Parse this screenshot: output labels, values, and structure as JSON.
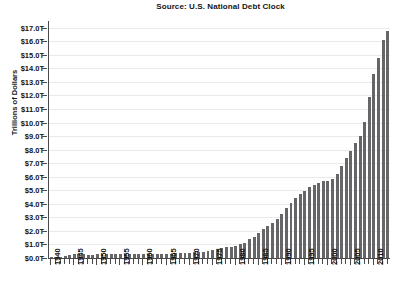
{
  "chart_data": {
    "type": "bar",
    "title": "Source: U.S. National Debt Clock",
    "xlabel": "",
    "ylabel": "Trillions of Dollars",
    "ylim": [
      0,
      17.5
    ],
    "grid": true,
    "legend": "none",
    "y_tick_labels": [
      "$0.0T",
      "$1.0T",
      "$2.0T",
      "$3.0T",
      "$4.0T",
      "$5.0T",
      "$6.0T",
      "$7.0T",
      "$8.0T",
      "$9.0T",
      "$10.0T",
      "$11.0T",
      "$12.0T",
      "$13.0T",
      "$14.0T",
      "$15.0T",
      "$16.0T",
      "$17.0T"
    ],
    "y_tick_values": [
      0,
      1,
      2,
      3,
      4,
      5,
      6,
      7,
      8,
      9,
      10,
      11,
      12,
      13,
      14,
      15,
      16,
      17
    ],
    "x_tick_labels": [
      "1940",
      "1945",
      "1950",
      "1955",
      "1960",
      "1965",
      "1970",
      "1975",
      "1980",
      "1985",
      "1990",
      "1995",
      "2000",
      "2005",
      "2010"
    ],
    "x_tick_values": [
      1940,
      1945,
      1950,
      1955,
      1960,
      1965,
      1970,
      1975,
      1980,
      1985,
      1990,
      1995,
      2000,
      2005,
      2010
    ],
    "categories": [
      1940,
      1941,
      1942,
      1943,
      1944,
      1945,
      1946,
      1947,
      1948,
      1949,
      1950,
      1951,
      1952,
      1953,
      1954,
      1955,
      1956,
      1957,
      1958,
      1959,
      1960,
      1961,
      1962,
      1963,
      1964,
      1965,
      1966,
      1967,
      1968,
      1969,
      1970,
      1971,
      1972,
      1973,
      1974,
      1975,
      1976,
      1977,
      1978,
      1979,
      1980,
      1981,
      1982,
      1983,
      1984,
      1985,
      1986,
      1987,
      1988,
      1989,
      1990,
      1991,
      1992,
      1993,
      1994,
      1995,
      1996,
      1997,
      1998,
      1999,
      2000,
      2001,
      2002,
      2003,
      2004,
      2005,
      2006,
      2007,
      2008,
      2009,
      2010,
      2011,
      2012,
      2013
    ],
    "values": [
      0.05,
      0.06,
      0.08,
      0.14,
      0.2,
      0.26,
      0.27,
      0.26,
      0.25,
      0.25,
      0.26,
      0.26,
      0.26,
      0.27,
      0.27,
      0.27,
      0.27,
      0.27,
      0.28,
      0.29,
      0.29,
      0.29,
      0.3,
      0.31,
      0.32,
      0.32,
      0.33,
      0.34,
      0.36,
      0.37,
      0.38,
      0.41,
      0.44,
      0.47,
      0.49,
      0.58,
      0.65,
      0.72,
      0.79,
      0.85,
      0.91,
      1.0,
      1.14,
      1.38,
      1.57,
      1.82,
      2.13,
      2.35,
      2.6,
      2.86,
      3.23,
      3.67,
      4.07,
      4.41,
      4.69,
      4.97,
      5.22,
      5.41,
      5.53,
      5.66,
      5.67,
      5.81,
      6.23,
      6.78,
      7.38,
      7.93,
      8.51,
      9.01,
      10.02,
      11.91,
      13.56,
      14.79,
      16.07,
      16.74
    ],
    "bar_color": "#666668",
    "gridline_color": "#e9e9ec",
    "axis_color": "#4a4a4a"
  }
}
